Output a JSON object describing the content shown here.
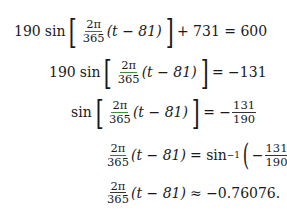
{
  "equations": [
    {
      "coef": "190",
      "fn": "sin",
      "frac_num": "2π",
      "frac_den": "365",
      "arg": "(t − 81)",
      "rest": "+ 731 = 600"
    },
    {
      "coef": "190",
      "fn": "sin",
      "frac_num": "2π",
      "frac_den": "365",
      "arg": "(t − 81)",
      "rest": "= −131"
    },
    {
      "coef": "",
      "fn": "sin",
      "frac_num": "2π",
      "frac_den": "365",
      "arg": "(t − 81)",
      "rest": "= −",
      "rhs_num": "131",
      "rhs_den": "190"
    },
    {
      "frac_num": "2π",
      "frac_den": "365",
      "arg": "(t − 81)",
      "rel": "= sin",
      "sup": "−1",
      "minus": "−",
      "rhs_num": "131",
      "rhs_den": "190"
    },
    {
      "frac_num": "2π",
      "frac_den": "365",
      "arg": "(t − 81)",
      "rest": "≈ −0.76076."
    }
  ]
}
